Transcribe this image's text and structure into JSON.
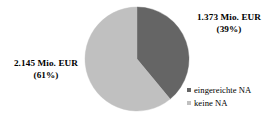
{
  "chart_data": {
    "type": "pie",
    "title": "",
    "subtitle": "",
    "xlabel": "",
    "ylabel": "",
    "grid": false,
    "legend_position": "bottom-right",
    "categories": [
      "eingereichte NA",
      "keine NA"
    ],
    "values": [
      1.373,
      2.145
    ],
    "value_unit": "Mio. EUR",
    "percentages": [
      39,
      61
    ],
    "colors": [
      "#656565",
      "#c0c0c0"
    ],
    "slices": [
      {
        "name": "eingereichte NA",
        "value": 1.373,
        "percent": 39,
        "color": "#656565",
        "label_value": "1.373 Mio. EUR",
        "label_percent": "(39%)"
      },
      {
        "name": "keine NA",
        "value": 2.145,
        "percent": 61,
        "color": "#c0c0c0",
        "label_value": "2.145 Mio. EUR",
        "label_percent": "(61%)"
      }
    ],
    "start_angle_deg": 0,
    "direction": "clockwise"
  },
  "labels": {
    "dark": {
      "value": "1.373 Mio. EUR",
      "percent": "(39%)"
    },
    "light": {
      "value": "2.145 Mio. EUR",
      "percent": "(61%)"
    }
  },
  "legend": {
    "items": [
      {
        "label": "eingereichte NA",
        "color": "#656565"
      },
      {
        "label": "keine NA",
        "color": "#c0c0c0"
      }
    ]
  },
  "style": {
    "background": "#ffffff",
    "text_color": "#000000",
    "dark_slice_color": "#656565",
    "light_slice_color": "#c0c0c0"
  }
}
